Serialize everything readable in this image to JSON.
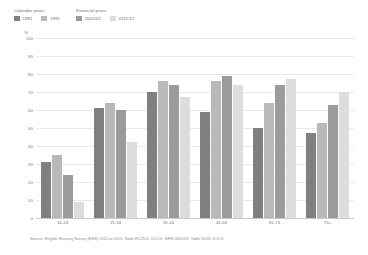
{
  "legend": {
    "groups": [
      {
        "name": "calendar-years",
        "title": "Calendar years",
        "items": [
          {
            "label": "1981",
            "color": "#808080"
          },
          {
            "label": "1991",
            "color": "#b9b9b9"
          }
        ]
      },
      {
        "name": "financial-years",
        "title": "Financial years",
        "items": [
          {
            "label": "2001/02",
            "color": "#9b9b9b"
          },
          {
            "label": "2011/12",
            "color": "#dddddd"
          }
        ]
      }
    ]
  },
  "axis": {
    "unit": "%",
    "yticks": [
      "100",
      "90",
      "80",
      "70",
      "60",
      "50",
      "40",
      "30",
      "20",
      "10",
      "0"
    ]
  },
  "source": {
    "text": "Source: English Housing Survey (EHS) 2012 to 2013, Table FC2101, DCLG ; EHS 2001/02, Table S109, DCLG"
  },
  "chart_data": {
    "type": "bar",
    "title": "",
    "subtitle": "",
    "xlabel": "",
    "ylabel": "%",
    "ylim": [
      0,
      100
    ],
    "ytick_step": 10,
    "grid": true,
    "legend_position": "top-left",
    "categories": [
      "16-24",
      "25-34",
      "35-44",
      "45-64",
      "65-74",
      "75+"
    ],
    "series": [
      {
        "name": "1981",
        "color": "#808080",
        "values": [
          31,
          61,
          70,
          59,
          50,
          47
        ]
      },
      {
        "name": "1991",
        "color": "#b9b9b9",
        "values": [
          35,
          64,
          76,
          76,
          64,
          53
        ]
      },
      {
        "name": "2001/02",
        "color": "#9b9b9b",
        "values": [
          24,
          60,
          74,
          79,
          74,
          63
        ]
      },
      {
        "name": "2011/12",
        "color": "#dddddd",
        "values": [
          9,
          42,
          67,
          74,
          77,
          70
        ]
      }
    ]
  }
}
